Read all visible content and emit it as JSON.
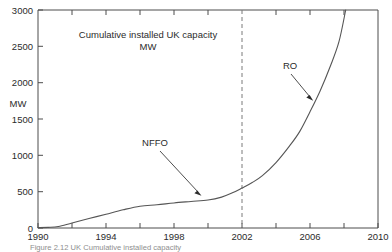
{
  "chart_data": {
    "type": "line",
    "title": "Cumulative installed UK capacity",
    "title_line2": "MW",
    "xlabel": "",
    "ylabel": "MW",
    "xlim": [
      1990,
      2010
    ],
    "ylim": [
      0,
      3000
    ],
    "grid": false,
    "legend": "none",
    "x_ticks": [
      1990,
      1992,
      1994,
      1996,
      1998,
      2000,
      2002,
      2004,
      2006,
      2008,
      2010
    ],
    "x_tick_labels": [
      "1990",
      "",
      "1994",
      "",
      "1998",
      "",
      "2002",
      "",
      "2006",
      "",
      "2010"
    ],
    "y_ticks": [
      0,
      500,
      1000,
      1500,
      2000,
      2500,
      3000
    ],
    "y_tick_labels": [
      "0",
      "500",
      "1000",
      "1500",
      "2000",
      "2500",
      "3000"
    ],
    "series": [
      {
        "name": "Cumulative installed UK capacity",
        "x": [
          1990,
          1990.6,
          1991.2,
          1992,
          1993,
          1994,
          1995,
          1996,
          1997,
          1998,
          1999,
          2000,
          2000.8,
          2001.4,
          2002,
          2002.6,
          2003.2,
          2004,
          2004.8,
          2005.4,
          2006,
          2006.6,
          2007.2,
          2007.7,
          2008.1
        ],
        "y": [
          5,
          8,
          20,
          70,
          130,
          190,
          250,
          300,
          320,
          345,
          365,
          385,
          425,
          480,
          550,
          625,
          720,
          900,
          1130,
          1330,
          1600,
          1890,
          2230,
          2560,
          3000
        ]
      }
    ],
    "vertical_marker": {
      "x": 2002,
      "style": "dashed",
      "label": "2002"
    },
    "annotations": [
      {
        "label": "NFFO",
        "text_x": 1996.9,
        "text_y": 1075,
        "point_x": 1999.8,
        "point_y": 430
      },
      {
        "label": "RO",
        "text_x": 2004.6,
        "text_y": 2265,
        "point_x": 2005.6,
        "point_y": 1560
      }
    ]
  },
  "caption": {
    "text": "Figure 2.12 UK Cumulative installed capacity"
  }
}
